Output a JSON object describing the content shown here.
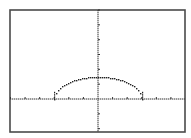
{
  "calculator": {
    "screen": "graph",
    "window": {
      "xmin": -6,
      "xmax": 6,
      "xscl": 1,
      "ymin": -2.2,
      "ymax": 6,
      "yscl": 1
    },
    "frame": {
      "left": 10,
      "top": 10,
      "right": 185,
      "bottom": 132
    },
    "origin_px": {
      "x": 98,
      "y": 99
    },
    "colors": {
      "background": "#ffffff",
      "frame": "#4a4a4a",
      "axes": "#333333",
      "plot": "#222222"
    }
  },
  "chart_data": {
    "type": "line",
    "title": "",
    "xlabel": "",
    "ylabel": "",
    "xlim": [
      -6,
      6
    ],
    "ylim": [
      -2.2,
      6
    ],
    "grid": false,
    "legend": null,
    "x_ticks": [
      -6,
      -5,
      -4,
      -3,
      -2,
      -1,
      0,
      1,
      2,
      3,
      4,
      5,
      6
    ],
    "y_ticks": [
      -2,
      -1,
      0,
      1,
      2,
      3,
      4,
      5,
      6
    ],
    "series": [
      {
        "name": "Y1",
        "style": "dotted-pixel",
        "x": [
          -3,
          -2.8,
          -2.5,
          -2.2,
          -2,
          -1.6,
          -1.2,
          -0.8,
          -0.4,
          0,
          0.4,
          0.8,
          1.2,
          1.6,
          2,
          2.2,
          2.5,
          2.8,
          3
        ],
        "y": [
          0,
          0.54,
          0.83,
          1.02,
          1.12,
          1.27,
          1.37,
          1.45,
          1.49,
          1.5,
          1.49,
          1.45,
          1.37,
          1.27,
          1.12,
          1.02,
          0.83,
          0.54,
          0
        ]
      }
    ]
  }
}
